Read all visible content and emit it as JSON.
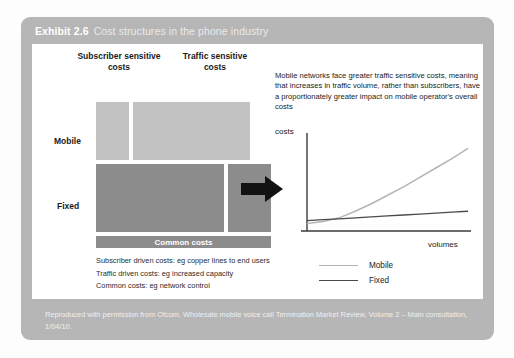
{
  "exhibit": {
    "number": "Exhibit 2.6",
    "title": "Cost structures in the phone industry"
  },
  "matrix": {
    "column_headers": [
      "Subscriber sensitive\ncosts",
      "Traffic sensitive\ncosts"
    ],
    "column_header_sub": "Subscriber sensitive costs",
    "column_header_traffic": "Traffic sensitive costs",
    "row_labels": [
      "Mobile",
      "Fixed"
    ],
    "row_label_mobile": "Mobile",
    "row_label_fixed": "Fixed",
    "common_bar_label": "Common costs",
    "cells": [
      {
        "row": "Mobile",
        "column": "Subscriber sensitive costs",
        "relative_size": "small",
        "color": "#c2c2c2"
      },
      {
        "row": "Mobile",
        "column": "Traffic sensitive costs",
        "relative_size": "large",
        "color": "#c2c2c2"
      },
      {
        "row": "Fixed",
        "column": "Subscriber sensitive costs",
        "relative_size": "large",
        "color": "#8c8c8c"
      },
      {
        "row": "Fixed",
        "column": "Traffic sensitive costs",
        "relative_size": "small",
        "color": "#8c8c8c"
      }
    ]
  },
  "notes": [
    "Subscriber driven costs: eg copper lines to end users",
    "Traffic driven costs: eg increased capacity",
    "Common costs: eg network control"
  ],
  "blurb": "Mobile networks face greater traffic sensitive costs, meaning that increases in traffic volume, rather than subscribers, have a proportionately greater impact on mobile operator's overall costs",
  "chart_data": {
    "type": "line",
    "title": "",
    "xlabel": "volumes",
    "ylabel": "costs",
    "grid": false,
    "legend_position": "bottom-left",
    "xlim": [
      0,
      100
    ],
    "ylim": [
      0,
      100
    ],
    "x": [
      0,
      10,
      20,
      30,
      40,
      50,
      60,
      70,
      80,
      90,
      100
    ],
    "series": [
      {
        "name": "Mobile",
        "color": "#b4b4b4",
        "values": [
          8,
          10,
          14,
          21,
          29,
          38,
          47,
          57,
          67,
          77,
          88
        ]
      },
      {
        "name": "Fixed",
        "color": "#4a4a4a",
        "values": [
          11,
          12,
          13,
          14,
          15,
          16,
          17,
          18,
          19,
          20,
          21
        ]
      }
    ]
  },
  "source": "Reproduced with permission from Ofcom. Wholesale mobile voice call Termination Market Review, Volume 2 – Main consultation, 1/04/10.",
  "colors": {
    "card": "#b6b6b6",
    "light_cell": "#c2c2c2",
    "dark_cell": "#8c8c8c",
    "arrow": "#121212"
  }
}
